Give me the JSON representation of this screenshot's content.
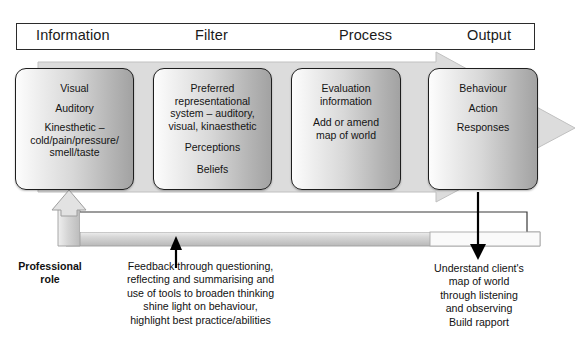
{
  "diagram": {
    "phases": [
      {
        "id": "information",
        "label": "Information"
      },
      {
        "id": "filter",
        "label": "Filter"
      },
      {
        "id": "process",
        "label": "Process"
      },
      {
        "id": "output",
        "label": "Output"
      }
    ],
    "stages": [
      {
        "id": "information",
        "lines": [
          "Visual",
          "Auditory",
          "Kinesthetic –\ncold/pain/pressure/\nsmell/taste"
        ]
      },
      {
        "id": "filter",
        "lines": [
          "Preferred\nrepresentational\nsystem – auditory,\nvisual, kinaesthetic",
          "Perceptions",
          "Beliefs"
        ]
      },
      {
        "id": "process",
        "lines": [
          "Evaluation\ninformation",
          "Add or amend\nmap of world"
        ]
      },
      {
        "id": "output",
        "lines": [
          "Behaviour",
          "Action",
          "Responses"
        ]
      }
    ],
    "captions": {
      "professional_role": "Professional\nrole",
      "feedback": "Feedback through questioning,\nreflecting and summarising and\nuse of tools to broaden thinking\nshine light on behaviour,\nhighlight best practice/abilities",
      "understand": "Understand client's\nmap of world\nthrough listening\nand observing\nBuild rapport"
    },
    "colors": {
      "arrow_body_fill": "#dcdcdc",
      "arrow_body_stroke": "#b5b5b5",
      "box_stroke": "#1e1e1e",
      "box_gradient_light": "#fdfdfd",
      "box_gradient_dark": "#a2a2a2",
      "bar_background": "#ffffff",
      "bar_stroke": "#2b2b2b",
      "black_arrow": "#000000",
      "loop_fill": "#d0d0d0",
      "page_background": "#ffffff"
    }
  }
}
